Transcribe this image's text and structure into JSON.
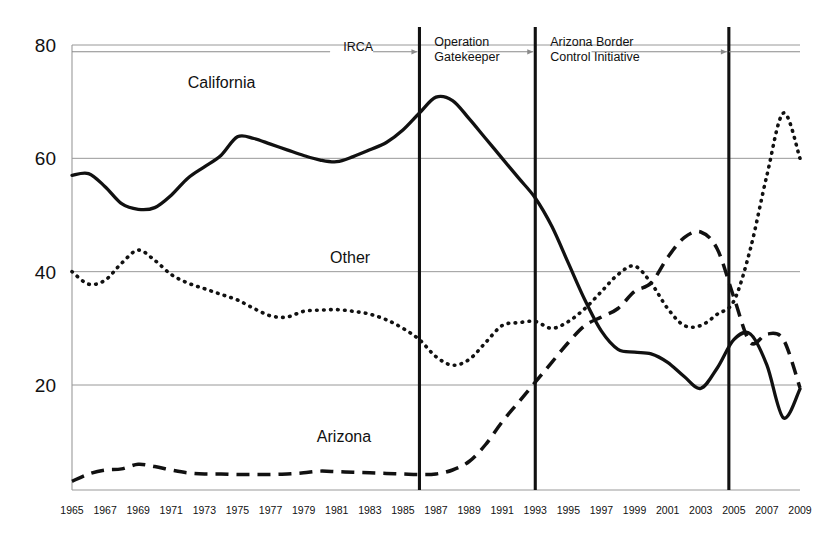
{
  "chart_data": {
    "type": "line",
    "title": "",
    "subtitle": "",
    "xlabel": "",
    "ylabel": "",
    "xlim": [
      1965,
      2009
    ],
    "ylim": [
      0,
      80
    ],
    "ytick_labels": [
      "80",
      "60",
      "40",
      "20"
    ],
    "yticks": [
      80,
      60,
      40,
      20
    ],
    "grid": true,
    "legend_position": "inline-labels",
    "x": [
      1965,
      1966,
      1967,
      1968,
      1969,
      1970,
      1971,
      1972,
      1973,
      1974,
      1975,
      1976,
      1977,
      1978,
      1979,
      1980,
      1981,
      1982,
      1983,
      1984,
      1985,
      1986,
      1987,
      1988,
      1989,
      1990,
      1991,
      1992,
      1993,
      1994,
      1995,
      1996,
      1997,
      1998,
      1999,
      2000,
      2001,
      2002,
      2003,
      2004,
      2005,
      2006,
      2007,
      2008,
      2009
    ],
    "xtick_labels": [
      "1965",
      "1967",
      "1969",
      "1971",
      "1973",
      "1975",
      "1977",
      "1979",
      "1981",
      "1983",
      "1985",
      "1987",
      "1989",
      "1991",
      "1993",
      "1995",
      "1997",
      "1999",
      "2001",
      "2003",
      "2005",
      "2007",
      "2009"
    ],
    "series": [
      {
        "name": "California",
        "style": "solid",
        "values": [
          57.0,
          57.3,
          55.0,
          52.0,
          51.0,
          51.3,
          53.5,
          56.5,
          58.5,
          60.5,
          63.8,
          63.5,
          62.5,
          61.5,
          60.5,
          59.7,
          59.4,
          60.3,
          61.5,
          62.8,
          65.0,
          68.0,
          70.8,
          70.2,
          67.0,
          63.5,
          60.0,
          56.5,
          53.0,
          48.0,
          41.5,
          35.0,
          29.5,
          26.3,
          25.8,
          25.5,
          24.0,
          21.5,
          19.4,
          23.0,
          28.0,
          29.0,
          23.5,
          14.2,
          19.3
        ]
      },
      {
        "name": "Other",
        "style": "dotted",
        "values": [
          40.0,
          37.8,
          38.5,
          41.5,
          43.8,
          42.0,
          39.5,
          38.0,
          37.0,
          36.0,
          35.0,
          33.5,
          32.2,
          32.0,
          33.0,
          33.2,
          33.3,
          33.0,
          32.5,
          31.5,
          30.0,
          28.0,
          25.0,
          23.5,
          24.5,
          27.5,
          30.5,
          31.0,
          31.2,
          30.0,
          31.2,
          33.5,
          36.5,
          39.5,
          41.0,
          38.0,
          33.5,
          30.5,
          30.5,
          32.5,
          34.8,
          44.0,
          57.0,
          68.0,
          60.0
        ]
      },
      {
        "name": "Arizona",
        "style": "dashed",
        "values": [
          3.0,
          4.3,
          5.0,
          5.2,
          6.0,
          5.6,
          5.0,
          4.5,
          4.3,
          4.3,
          4.2,
          4.2,
          4.2,
          4.3,
          4.5,
          4.8,
          4.7,
          4.6,
          4.5,
          4.4,
          4.3,
          4.2,
          4.3,
          5.0,
          6.5,
          9.5,
          13.5,
          17.0,
          20.5,
          24.0,
          27.5,
          30.5,
          32.0,
          33.5,
          36.5,
          38.0,
          42.5,
          46.0,
          47.0,
          44.0,
          35.5,
          27.5,
          29.0,
          28.0,
          19.5
        ]
      }
    ],
    "series_labels": [
      {
        "text": "California",
        "x": 1972.0,
        "y": 72.5
      },
      {
        "text": "Other",
        "x": 1980.6,
        "y": 41.5
      },
      {
        "text": "Arizona",
        "x": 1979.8,
        "y": 10.0
      }
    ],
    "annotations": [
      {
        "text": "IRCA",
        "lines": [
          "IRCA"
        ],
        "event_year": 1986,
        "label_x": 1981.4,
        "label_y": 79.3
      },
      {
        "text": "Operation Gatekeeper",
        "lines": [
          "Operation",
          "Gatekeeper"
        ],
        "event_year": 1993,
        "label_x": 1986.9,
        "label_y": 79.3
      },
      {
        "text": "Arizona Border Control Initiative",
        "lines": [
          "Arizona Border",
          "Control Initiative"
        ],
        "event_year": 2004.7,
        "label_x": 1993.9,
        "label_y": 79.3
      }
    ],
    "event_lines": [
      1986,
      1993,
      2004.7
    ]
  },
  "colors": {
    "background": "#ffffff",
    "ink": "#111111",
    "grid": "#8d8d8d",
    "axis": "#9a9a9a",
    "event": "#111111",
    "arrow": "#8a8a8a"
  }
}
